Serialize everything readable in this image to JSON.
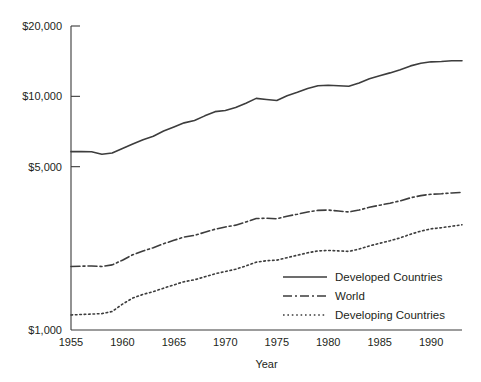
{
  "chart_data": {
    "type": "line",
    "title": "",
    "xlabel": "Year",
    "ylabel": "",
    "yscale": "log",
    "ylim": [
      1000,
      20000
    ],
    "xlim": [
      1955,
      1993
    ],
    "grid": false,
    "legend_position": "bottom-right",
    "ytick_labels": [
      "$20,000",
      "$10,000",
      "$5,000",
      "$1,000"
    ],
    "ytick_values": [
      20000,
      10000,
      5000,
      1000
    ],
    "xtick_labels": [
      "1955",
      "1960",
      "1965",
      "1970",
      "1975",
      "1980",
      "1985",
      "1990"
    ],
    "xtick_values": [
      1955,
      1960,
      1965,
      1970,
      1975,
      1980,
      1985,
      1990
    ],
    "x": [
      1955,
      1956,
      1957,
      1958,
      1959,
      1960,
      1961,
      1962,
      1963,
      1964,
      1965,
      1966,
      1967,
      1968,
      1969,
      1970,
      1971,
      1972,
      1973,
      1974,
      1975,
      1976,
      1977,
      1978,
      1979,
      1980,
      1981,
      1982,
      1983,
      1984,
      1985,
      1986,
      1987,
      1988,
      1989,
      1990,
      1991,
      1992,
      1993
    ],
    "series": [
      {
        "name": "Developed Countries",
        "style": "solid",
        "color": "#3d3d3d",
        "values": [
          5800,
          5810,
          5790,
          5650,
          5720,
          5980,
          6250,
          6520,
          6750,
          7100,
          7400,
          7700,
          7880,
          8250,
          8600,
          8700,
          8950,
          9350,
          9800,
          9700,
          9600,
          10050,
          10400,
          10800,
          11100,
          11150,
          11100,
          11050,
          11400,
          11900,
          12250,
          12600,
          13000,
          13500,
          13850,
          14050,
          14100,
          14200,
          14200
        ]
      },
      {
        "name": "World",
        "style": "dashdot",
        "color": "#3d3d3d",
        "values": [
          1870,
          1875,
          1880,
          1870,
          1900,
          1990,
          2100,
          2180,
          2250,
          2340,
          2420,
          2500,
          2540,
          2620,
          2700,
          2760,
          2810,
          2900,
          3000,
          3010,
          2990,
          3070,
          3130,
          3200,
          3250,
          3260,
          3230,
          3200,
          3260,
          3350,
          3420,
          3490,
          3570,
          3680,
          3760,
          3810,
          3830,
          3860,
          3880
        ]
      },
      {
        "name": "Developing Countries",
        "style": "dotted",
        "color": "#3d3d3d",
        "values": [
          1160,
          1165,
          1170,
          1175,
          1200,
          1290,
          1370,
          1420,
          1460,
          1510,
          1560,
          1610,
          1640,
          1690,
          1740,
          1780,
          1820,
          1880,
          1950,
          1980,
          1990,
          2040,
          2090,
          2140,
          2180,
          2190,
          2180,
          2170,
          2220,
          2290,
          2350,
          2410,
          2480,
          2570,
          2650,
          2710,
          2740,
          2780,
          2820
        ]
      }
    ]
  },
  "legend": {
    "items": [
      {
        "label": "Developed Countries",
        "style": "solid"
      },
      {
        "label": "World",
        "style": "dashdot"
      },
      {
        "label": "Developing Countries",
        "style": "dotted"
      }
    ]
  }
}
